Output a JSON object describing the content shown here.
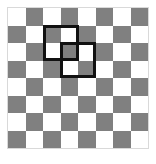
{
  "figure": {
    "width": 156,
    "height": 164
  },
  "board": {
    "rows": 8,
    "columns": 8,
    "cell_size": 17.5,
    "origin_x": 8,
    "origin_y": 8,
    "top_left_color": "light",
    "colors": {
      "light": "#ffffff",
      "dark": "#808080",
      "frame": "#d9d9d9",
      "outline": "#111111",
      "background": "#ffffff"
    },
    "pattern": [
      [
        "light",
        "dark",
        "light",
        "dark",
        "light",
        "dark",
        "light",
        "dark"
      ],
      [
        "dark",
        "light",
        "dark",
        "light",
        "dark",
        "light",
        "dark",
        "light"
      ],
      [
        "light",
        "dark",
        "light",
        "dark",
        "light",
        "dark",
        "light",
        "dark"
      ],
      [
        "dark",
        "light",
        "dark",
        "light",
        "dark",
        "light",
        "dark",
        "light"
      ],
      [
        "light",
        "dark",
        "light",
        "dark",
        "light",
        "dark",
        "light",
        "dark"
      ],
      [
        "dark",
        "light",
        "dark",
        "light",
        "dark",
        "light",
        "dark",
        "light"
      ],
      [
        "light",
        "dark",
        "light",
        "dark",
        "light",
        "dark",
        "light",
        "dark"
      ],
      [
        "dark",
        "light",
        "dark",
        "light",
        "dark",
        "light",
        "dark",
        "light"
      ]
    ]
  },
  "selections": [
    {
      "name": "upper-left-selection",
      "col": 2,
      "row": 1,
      "span_cols": 2,
      "span_rows": 2,
      "left": 43,
      "top": 25,
      "width": 36,
      "height": 36,
      "stroke_width": 3,
      "stroke_color": "#111111"
    },
    {
      "name": "lower-right-selection",
      "col": 3,
      "row": 2,
      "span_cols": 2,
      "span_rows": 2,
      "left": 60,
      "top": 42,
      "width": 36,
      "height": 36,
      "stroke_width": 3,
      "stroke_color": "#111111"
    }
  ]
}
